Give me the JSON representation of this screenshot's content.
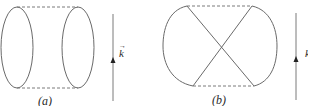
{
  "figure": {
    "panels": [
      {
        "id": "a",
        "caption": "(a)",
        "description": "Two ellipses (cylinder) connected by dashed lines at top and bottom",
        "momentum_label": "k",
        "momentum_vector_mark": "→"
      },
      {
        "id": "b",
        "caption": "(b)",
        "description": "Two half-ellipse arcs joined by crossing lines, dashed lines at top and bottom",
        "momentum_label": "k",
        "momentum_vector_mark": "→"
      }
    ],
    "colors": {
      "line": "#6a6a6a",
      "dashed": "#7a7a7a",
      "arrow": "#222222",
      "text": "#2a2a2a"
    }
  }
}
